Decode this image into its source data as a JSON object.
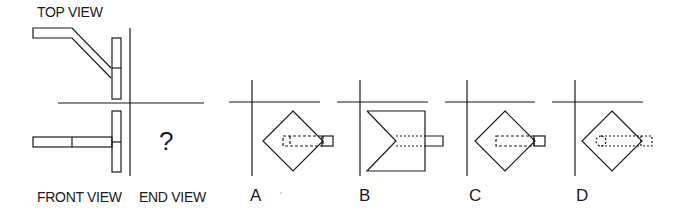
{
  "problem": {
    "labels": {
      "top_view": "TOP VIEW",
      "front_view": "FRONT VIEW",
      "end_view": "END VIEW",
      "unknown": "?"
    },
    "options": [
      {
        "letter": "A",
        "shape": "diamond",
        "feature": "dashed-slot-with-solid-tab"
      },
      {
        "letter": "B",
        "shape": "square-with-v-notch",
        "feature": "dotted-slot-with-solid-tab"
      },
      {
        "letter": "C",
        "shape": "diamond",
        "feature": "dashed-slot-with-solid-tab"
      },
      {
        "letter": "D",
        "shape": "diamond",
        "feature": "dotted-slot-round-end-with-dashed-tab"
      }
    ],
    "colors": {
      "line": "#1a1a1a",
      "background": "#ffffff"
    }
  }
}
